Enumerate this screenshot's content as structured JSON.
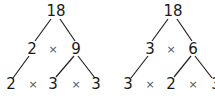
{
  "trees": [
    {
      "root": "18",
      "level1": {
        "left": "2",
        "op": "×",
        "right": "9"
      },
      "level2": [
        "2",
        "×",
        "3",
        "×",
        "3"
      ]
    },
    {
      "root": "18",
      "level1": {
        "left": "3",
        "op": "×",
        "right": "6"
      },
      "level2": [
        "3",
        "×",
        "2",
        "×",
        "3"
      ]
    }
  ],
  "colors": {
    "text": "#1a1a1a",
    "line": "#222222",
    "background": "#ffffff"
  }
}
